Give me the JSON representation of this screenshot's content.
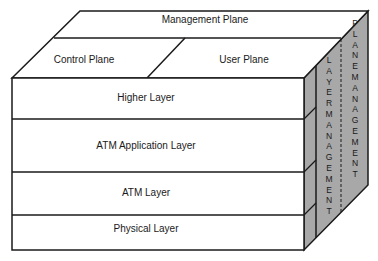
{
  "diagram": {
    "type": "3d-cube-model",
    "title": "",
    "top_face": {
      "management_plane": "Management Plane",
      "control_plane": "Control Plane",
      "user_plane": "User Plane"
    },
    "front_face": {
      "layers": [
        {
          "label": "Higher Layer"
        },
        {
          "label": "ATM Application Layer"
        },
        {
          "label": "ATM Layer"
        },
        {
          "label": "Physical Layer"
        }
      ]
    },
    "side_face": {
      "layer_management": "LAYERMANAGEMENT",
      "plane_management": "PLANEMANAGEMENT"
    },
    "colors": {
      "side_fill": "#a8a8a8",
      "stroke": "#1a1a1a",
      "face_fill": "#ffffff"
    }
  }
}
